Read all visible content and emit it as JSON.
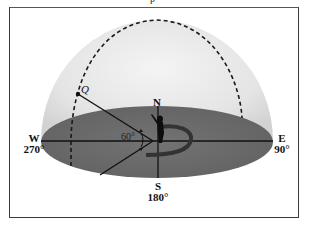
{
  "header": {
    "cut_text": "p"
  },
  "compass": {
    "north": {
      "letter": "N"
    },
    "east": {
      "letter": "E",
      "degrees": "90°"
    },
    "south": {
      "letter": "S",
      "degrees": "180°"
    },
    "west": {
      "letter": "W",
      "degrees": "270°"
    }
  },
  "point": {
    "label": "Q"
  },
  "angle": {
    "label": "60°"
  },
  "colors": {
    "dome": "#e2e2e2",
    "ground": "#6b6b6b",
    "lines": "#111111",
    "frame": "#3a3a3a"
  }
}
